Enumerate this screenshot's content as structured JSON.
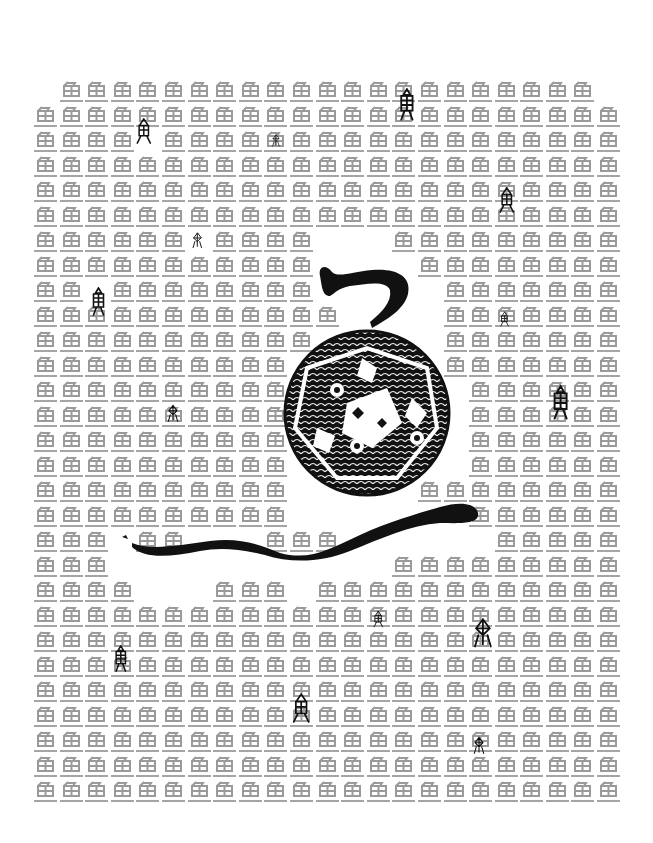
{
  "poster": {
    "grid_character": "鱼",
    "grid_color": "#9a9a9a",
    "ink_color": "#111111",
    "columns": 23,
    "rows": 29,
    "mask": [
      "0111111111111111111111",
      "11111111111111111111111",
      "11110111111111111111111",
      "11111111111111111111111",
      "11111111111111111111111",
      "11111111111111111111111",
      "11111101111000111111111",
      "11111111111000011111111",
      "11011111111000001111111",
      "11111111111100001111111",
      "11111111111000001111111",
      "11111111110000001111111",
      "11111111110000000111111",
      "11111111110000000111111",
      "11111111110000000111111",
      "11111111110000000111111",
      "11111111110000011111111",
      "11111111110000000111111",
      "11101100011100000011111",
      "11100000000000111111111",
      "11110001110111111111111",
      "11111111111111111111111",
      "11111111111111111111111",
      "11111111111111111111111",
      "11111111111111111111111",
      "11111111111111111111111",
      "11111111111111111111111",
      "11111111111111111111111",
      "11111111111111111111111"
    ]
  },
  "ancient_glyphs": [
    {
      "name": "fish-glyph-1",
      "x": 134,
      "y": 117,
      "size": 28
    },
    {
      "name": "fish-glyph-2",
      "x": 271,
      "y": 133,
      "size": 14
    },
    {
      "name": "fish-glyph-3",
      "x": 395,
      "y": 88,
      "size": 34
    },
    {
      "name": "fish-glyph-4",
      "x": 497,
      "y": 186,
      "size": 28
    },
    {
      "name": "fish-glyph-5",
      "x": 191,
      "y": 232,
      "size": 18
    },
    {
      "name": "fish-glyph-6",
      "x": 88,
      "y": 287,
      "size": 30
    },
    {
      "name": "fish-glyph-7",
      "x": 499,
      "y": 311,
      "size": 16
    },
    {
      "name": "fish-glyph-8",
      "x": 166,
      "y": 404,
      "size": 20
    },
    {
      "name": "fish-glyph-9",
      "x": 548,
      "y": 385,
      "size": 36
    },
    {
      "name": "fish-glyph-10",
      "x": 372,
      "y": 610,
      "size": 18
    },
    {
      "name": "fish-glyph-11",
      "x": 471,
      "y": 617,
      "size": 34
    },
    {
      "name": "fish-glyph-12",
      "x": 111,
      "y": 645,
      "size": 28
    },
    {
      "name": "fish-glyph-13",
      "x": 290,
      "y": 692,
      "size": 32
    },
    {
      "name": "fish-glyph-14",
      "x": 472,
      "y": 736,
      "size": 20
    }
  ]
}
